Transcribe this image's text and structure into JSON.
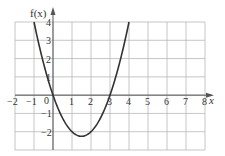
{
  "chart_data": {
    "type": "line",
    "title": "",
    "xlabel": "x",
    "ylabel": "f(x)",
    "function": "f(x) = x^2 - 3x",
    "xlim": [
      -2,
      8
    ],
    "ylim": [
      -3,
      4
    ],
    "grid": true,
    "x_ticks": [
      -2,
      -1,
      1,
      2,
      3,
      4,
      5,
      6,
      7,
      8
    ],
    "x_tick_labels": [
      "−2",
      "−1",
      "1",
      "2",
      "3",
      "4",
      "5",
      "6",
      "7",
      "8"
    ],
    "y_ticks": [
      4,
      3,
      2,
      1,
      -1,
      -2
    ],
    "y_tick_labels": [
      "4",
      "3",
      "2",
      "1",
      "−1",
      "−2"
    ],
    "origin_label": "0",
    "series": [
      {
        "name": "f(x)",
        "x": [
          -1,
          -0.5,
          0,
          0.5,
          1,
          1.5,
          2,
          2.5,
          3,
          3.5,
          4
        ],
        "values": [
          4,
          1.75,
          0,
          -1.25,
          -2,
          -2.25,
          -2,
          -1.25,
          0,
          1.75,
          4
        ]
      }
    ],
    "colors": {
      "grid": "#b8b8b8",
      "axis": "#555555",
      "curve": "#333333"
    }
  }
}
